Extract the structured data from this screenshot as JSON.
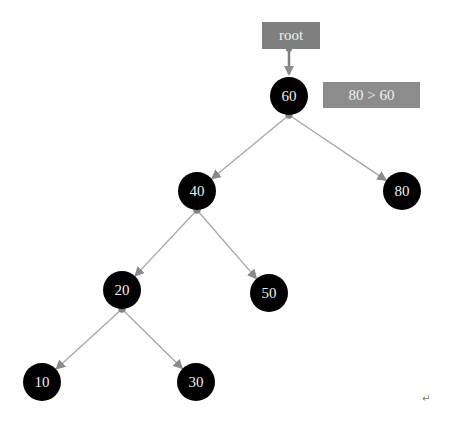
{
  "labels": {
    "root": "root",
    "comparison": "80 > 60",
    "return_mark": "↵"
  },
  "nodes": [
    {
      "id": "n60",
      "value": "60",
      "x": 289,
      "y": 96
    },
    {
      "id": "n40",
      "value": "40",
      "x": 197,
      "y": 191
    },
    {
      "id": "n80",
      "value": "80",
      "x": 402,
      "y": 191
    },
    {
      "id": "n20",
      "value": "20",
      "x": 122,
      "y": 290
    },
    {
      "id": "n50",
      "value": "50",
      "x": 269,
      "y": 293
    },
    {
      "id": "n10",
      "value": "10",
      "x": 42,
      "y": 382
    },
    {
      "id": "n30",
      "value": "30",
      "x": 196,
      "y": 382
    }
  ],
  "edges": [
    {
      "from": "n60",
      "to": "n40"
    },
    {
      "from": "n60",
      "to": "n80"
    },
    {
      "from": "n40",
      "to": "n20"
    },
    {
      "from": "n40",
      "to": "n50"
    },
    {
      "from": "n20",
      "to": "n10"
    },
    {
      "from": "n20",
      "to": "n30"
    }
  ],
  "colors": {
    "node_fill": "#000000",
    "node_text": "#eeeeee",
    "edge": "#a6a6a6",
    "label_box": "#7f7f7f"
  }
}
